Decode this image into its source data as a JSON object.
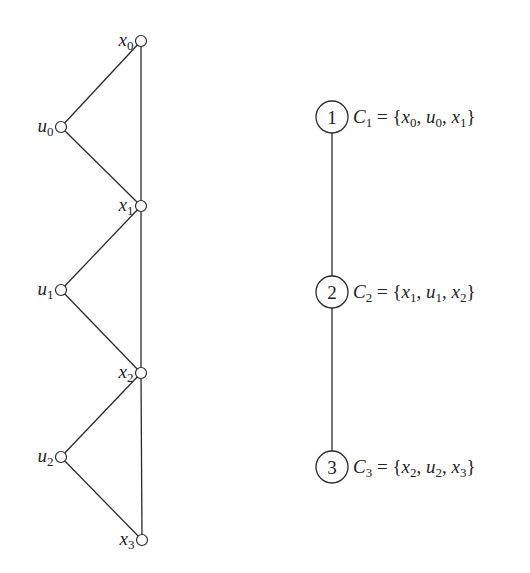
{
  "graph": {
    "vertices": [
      {
        "id": "x0",
        "base": "x",
        "sub": "0",
        "cx": 141,
        "cy": 41,
        "label_side": "left"
      },
      {
        "id": "u0",
        "base": "u",
        "sub": "0",
        "cx": 61,
        "cy": 127,
        "label_side": "left"
      },
      {
        "id": "x1",
        "base": "x",
        "sub": "1",
        "cx": 141,
        "cy": 206,
        "label_side": "left"
      },
      {
        "id": "u1",
        "base": "u",
        "sub": "1",
        "cx": 61,
        "cy": 290,
        "label_side": "left"
      },
      {
        "id": "x2",
        "base": "x",
        "sub": "2",
        "cx": 141,
        "cy": 373,
        "label_side": "left"
      },
      {
        "id": "u2",
        "base": "u",
        "sub": "2",
        "cx": 61,
        "cy": 457,
        "label_side": "left"
      },
      {
        "id": "x3",
        "base": "x",
        "sub": "3",
        "cx": 142,
        "cy": 540,
        "label_side": "left"
      }
    ],
    "edges": [
      [
        "x0",
        "u0"
      ],
      [
        "u0",
        "x1"
      ],
      [
        "x0",
        "x1"
      ],
      [
        "x1",
        "u1"
      ],
      [
        "u1",
        "x2"
      ],
      [
        "x1",
        "x2"
      ],
      [
        "x2",
        "u2"
      ],
      [
        "u2",
        "x3"
      ],
      [
        "x2",
        "x3"
      ]
    ]
  },
  "clique_tree": {
    "nodes": [
      {
        "num": "1",
        "cx": 332,
        "cy": 117,
        "name_base": "C",
        "name_sub": "1",
        "eq": "=",
        "members": [
          {
            "b": "x",
            "s": "0"
          },
          {
            "b": "u",
            "s": "0"
          },
          {
            "b": "x",
            "s": "1"
          }
        ]
      },
      {
        "num": "2",
        "cx": 332,
        "cy": 292,
        "name_base": "C",
        "name_sub": "2",
        "eq": "=",
        "members": [
          {
            "b": "x",
            "s": "1"
          },
          {
            "b": "u",
            "s": "1"
          },
          {
            "b": "x",
            "s": "2"
          }
        ]
      },
      {
        "num": "3",
        "cx": 332,
        "cy": 467,
        "name_base": "C",
        "name_sub": "3",
        "eq": "=",
        "members": [
          {
            "b": "x",
            "s": "2"
          },
          {
            "b": "u",
            "s": "2"
          },
          {
            "b": "x",
            "s": "3"
          }
        ]
      }
    ],
    "edges": [
      [
        "1",
        "2"
      ],
      [
        "2",
        "3"
      ]
    ]
  },
  "colors": {
    "stroke": "#2a2a2a",
    "background": "#ffffff"
  }
}
